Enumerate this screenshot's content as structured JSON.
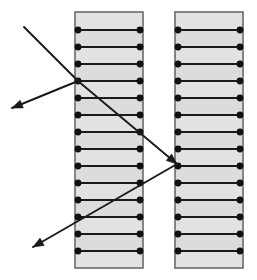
{
  "figure": {
    "background_color": "#ffffff",
    "canvas": {
      "width": 257,
      "height": 280
    }
  },
  "style": {
    "layer_fill": "#dcdcdc",
    "layer_fill_alt": "#e2e2e2",
    "layer_edge": "#555555",
    "interface_color": "#1a1a1a",
    "node_color": "#111111",
    "ray_color": "#1a1a1a",
    "outline_color": "#6b6b6b",
    "node_radius": 3.4,
    "interface_stroke_width": 2.0,
    "ray_stroke_width": 1.9
  },
  "stacks": [
    {
      "name": "left-stack",
      "label": "Left multilayer stack",
      "x": 75,
      "y": 12,
      "width": 68,
      "height": 256,
      "layer_count": 15,
      "interface_y": [
        30,
        47,
        64,
        81,
        98,
        115,
        132,
        149,
        166,
        183,
        200,
        217,
        234,
        251
      ],
      "node_x": [
        78,
        140
      ]
    },
    {
      "name": "right-stack",
      "label": "Right multilayer stack",
      "x": 175,
      "y": 12,
      "width": 68,
      "height": 256,
      "layer_count": 15,
      "interface_y": [
        30,
        47,
        64,
        81,
        98,
        115,
        132,
        149,
        166,
        183,
        200,
        217,
        234,
        251
      ],
      "node_x": [
        178,
        240
      ]
    }
  ],
  "rays": [
    {
      "name": "incident-ray",
      "label": "Incident ray",
      "from": {
        "x": 24,
        "y": 27
      },
      "to": {
        "x": 78,
        "y": 81
      },
      "arrowhead": false
    },
    {
      "name": "reflected-ray-upper",
      "label": "Reflected ray from left stack surface",
      "from": {
        "x": 78,
        "y": 81
      },
      "to": {
        "x": 12,
        "y": 108
      },
      "arrowhead": true
    },
    {
      "name": "transmitted-ray",
      "label": "Transmitted ray crossing to right stack",
      "from": {
        "x": 78,
        "y": 81
      },
      "to": {
        "x": 177,
        "y": 164
      },
      "arrowhead": true
    },
    {
      "name": "reflected-ray-lower",
      "label": "Reflected ray from right stack surface",
      "from": {
        "x": 177,
        "y": 164
      },
      "to": {
        "x": 33,
        "y": 247
      },
      "arrowhead": true
    }
  ],
  "chart_data": {
    "type": "diagram",
    "elements": {
      "stacks": 2,
      "layers_per_stack": 15,
      "interfaces_per_stack": 14,
      "nodes_per_stack": 28,
      "rays": 4,
      "arrowheads": 3
    },
    "ray_path_vertices": [
      [
        24,
        27
      ],
      [
        78,
        81
      ],
      [
        12,
        108
      ],
      [
        177,
        164
      ],
      [
        33,
        247
      ]
    ],
    "gap_between_stacks": {
      "x_start": 143,
      "x_end": 175,
      "width": 32
    }
  }
}
